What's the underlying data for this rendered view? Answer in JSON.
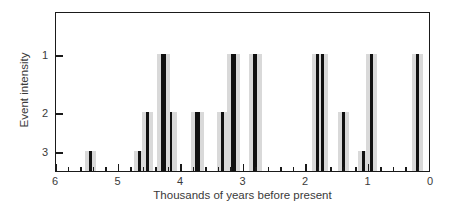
{
  "chart_data": {
    "type": "bar",
    "title": "",
    "xlabel": "Thousands of years before present",
    "ylabel": "Event intensity",
    "xlim": [
      6,
      0
    ],
    "ylim": [
      3.5,
      0.6
    ],
    "x_reversed": true,
    "y_reversed": true,
    "grid": false,
    "legend": null,
    "x_ticks": [
      6,
      5,
      4,
      3,
      2,
      1,
      0
    ],
    "x_tick_labels": [
      "6",
      "5",
      "4",
      "3",
      "2",
      "1",
      "0"
    ],
    "x_minor_step": 0.2,
    "y_ticks": [
      1,
      2,
      3
    ],
    "y_tick_labels": [
      "1",
      "2",
      "3"
    ],
    "x_unit": "thousands of years before present",
    "y_unit": "event intensity (1 = strongest)",
    "points": [
      {
        "x": 5.45,
        "intensity": 3
      },
      {
        "x": 4.67,
        "intensity": 3
      },
      {
        "x": 4.53,
        "intensity": 2
      },
      {
        "x": 4.3,
        "intensity": 1
      },
      {
        "x": 4.26,
        "intensity": 1
      },
      {
        "x": 4.16,
        "intensity": 2
      },
      {
        "x": 3.75,
        "intensity": 2
      },
      {
        "x": 3.72,
        "intensity": 2
      },
      {
        "x": 3.34,
        "intensity": 2
      },
      {
        "x": 3.18,
        "intensity": 1
      },
      {
        "x": 3.15,
        "intensity": 1
      },
      {
        "x": 2.82,
        "intensity": 1
      },
      {
        "x": 2.8,
        "intensity": 1
      },
      {
        "x": 1.82,
        "intensity": 1
      },
      {
        "x": 1.74,
        "intensity": 1
      },
      {
        "x": 1.4,
        "intensity": 2
      },
      {
        "x": 1.08,
        "intensity": 3
      },
      {
        "x": 0.95,
        "intensity": 1
      },
      {
        "x": 0.22,
        "intensity": 1
      }
    ]
  },
  "axes": {
    "x_title": "Thousands of years before present",
    "y_title": "Event intensity"
  }
}
